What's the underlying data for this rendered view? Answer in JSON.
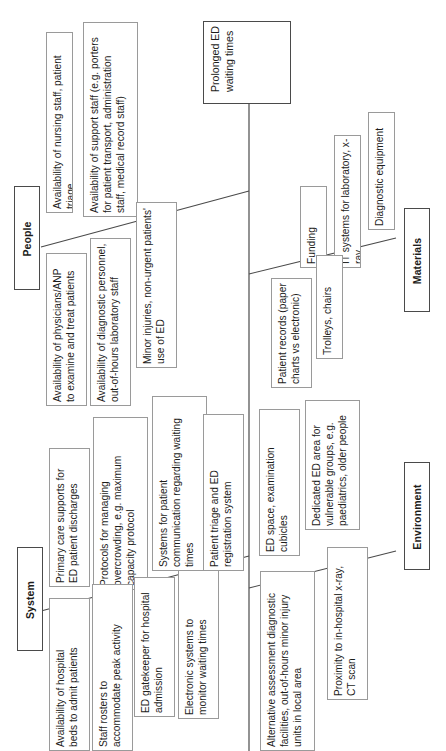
{
  "diagram": {
    "type": "fishbone-ishikawa",
    "orientation": "rotated-90-counterclockwise",
    "effect": {
      "label": "Prolonged ED\nwaiting times"
    },
    "categories": [
      {
        "id": "people",
        "label": "People",
        "causes": [
          "Availability of nursing staff, patient triage",
          "Availability of support staff (e.g. porters\nfor patient transport, administration\nstaff, medical record staff)",
          "Availability of physicians/ANP\nto examine and treat patients",
          "Availability of diagnostic personnel,\nout-of-hours laboratory staff",
          "Minor injuries, non-urgent patients'\nuse of ED"
        ]
      },
      {
        "id": "materials",
        "label": "Materials",
        "causes": [
          "Funding",
          "IT systems for laboratory, x-ray",
          "Diagnostic equipment",
          "Patient records (paper\ncharts vs electronic)",
          "Trolleys, chairs"
        ]
      },
      {
        "id": "system",
        "label": "System",
        "causes": [
          "Primary care supports for\nED patient discharges",
          "Protocols for managing\novercrowding, e.g. maximum\ncapacity protocol",
          "Systems for patient\ncommunication regarding waiting\ntimes",
          "Patient triage and ED\nregistration system",
          "Availability of hospital\nbeds to admit patients",
          "Staff rosters to\naccommodate peak activity",
          "ED gatekeeper for hospital\nadmission",
          "Electronic systems to\nmonitor waiting times"
        ]
      },
      {
        "id": "environment",
        "label": "Environment",
        "causes": [
          "ED space, examination\ncubicles",
          "Dedicated ED area for\nvulnerable groups, e.g.\npaediatrics, older people",
          "Alternative assessment diagnostic\nfacilities, out-of-hours minor injury\nunits in local area",
          "Proximity to in-hospital x-ray,\nCT scan"
        ]
      }
    ],
    "colors": {
      "line": "#4a4a4a",
      "box_border": "#9a9a9a",
      "category_border": "#4a4a4a",
      "text": "#1d1d1b",
      "background": "#ffffff"
    }
  }
}
